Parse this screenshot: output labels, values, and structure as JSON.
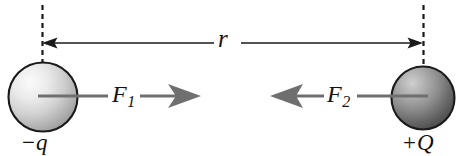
{
  "figure": {
    "background_color": "#ffffff",
    "width": 468,
    "height": 156
  },
  "labels": {
    "distance": "r",
    "force_left": "F",
    "force_left_subscript": "1",
    "force_right": "F",
    "force_right_subscript": "2",
    "charge_left_sign": "−",
    "charge_left_symbol": "q",
    "charge_right_sign": "+",
    "charge_right_symbol": "Q"
  },
  "charges": [
    {
      "name": "negative-charge",
      "label": "−q",
      "sign": "negative",
      "center_x": 43,
      "center_y": 97,
      "radius": 35,
      "fill_light": "#f2f2f2",
      "fill_dark": "#9a9a9a",
      "stroke": "#1a1a1a"
    },
    {
      "name": "positive-charge",
      "label": "+Q",
      "sign": "positive",
      "center_x": 423,
      "center_y": 98,
      "radius": 32,
      "fill_light": "#b8b8b8",
      "fill_dark": "#4a4a4a",
      "stroke": "#1a1a1a"
    }
  ],
  "dimension_arrow": {
    "name": "separation-distance",
    "label": "r",
    "x_start": 42,
    "x_end": 423,
    "y": 43,
    "double_headed": true,
    "color": "#1a1a1a"
  },
  "reference_lines": [
    {
      "name": "left-dashed-reference",
      "x": 42,
      "y_top": 5,
      "y_bottom": 66,
      "color": "#1a1a1a",
      "dash": "5 4"
    },
    {
      "name": "right-dashed-reference",
      "x": 423,
      "y_top": 5,
      "y_bottom": 68,
      "color": "#1a1a1a",
      "dash": "5 4"
    }
  ],
  "force_vectors": [
    {
      "name": "force-on-negative-charge",
      "label": "F₁",
      "direction": "right",
      "tail_x": 38,
      "tip_x": 201,
      "y": 96,
      "color": "#6f6f6f"
    },
    {
      "name": "force-on-positive-charge",
      "label": "F₂",
      "direction": "left",
      "tail_x": 428,
      "tip_x": 270,
      "y": 96,
      "color": "#6f6f6f"
    }
  ],
  "colors": {
    "line": "#1a1a1a",
    "force_arrow": "#6f6f6f",
    "text": "#111111"
  }
}
